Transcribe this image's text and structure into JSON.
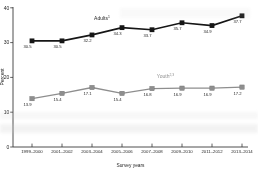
{
  "chart_data": {
    "type": "line",
    "title": "",
    "xlabel": "Survey years",
    "ylabel": "Percent",
    "ylim": [
      0,
      40
    ],
    "yticks": [
      0,
      10,
      20,
      30,
      40
    ],
    "grid": false,
    "legend_position": "inline-labels",
    "categories": [
      "1999–2000",
      "2001–2002",
      "2003–2004",
      "2005–2006",
      "2007–2008",
      "2009–2010",
      "2011–2012",
      "2013–2014"
    ],
    "series": [
      {
        "name": "Adults",
        "superscript": "1",
        "color": "#161616",
        "marker": "square",
        "values": [
          30.5,
          30.5,
          32.2,
          34.3,
          33.7,
          35.7,
          34.9,
          37.7
        ],
        "value_labels": [
          "30.5",
          "30.5",
          "32.2",
          "34.3",
          "33.7",
          "35.7",
          "34.9",
          "37.7"
        ]
      },
      {
        "name": "Youth",
        "superscript": "2,3",
        "color": "#8e8e8e",
        "marker": "square",
        "values": [
          13.9,
          15.4,
          17.1,
          15.4,
          16.8,
          16.9,
          16.9,
          17.2
        ],
        "value_labels": [
          "13.9",
          "15.4",
          "17.1",
          "15.4",
          "16.8",
          "16.9",
          "16.9",
          "17.2"
        ]
      }
    ],
    "colors": {
      "axis": "#3a3a3a",
      "tick_label": "#1f1f1f",
      "value_label": "#2a2a2a",
      "adults_label": "#1f1f1f",
      "youth_label": "#8e8e8e"
    }
  }
}
